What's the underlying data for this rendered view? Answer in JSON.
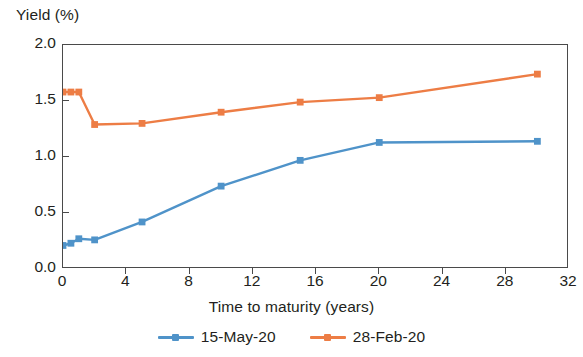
{
  "chart_data": {
    "type": "line",
    "title": "",
    "ylabel": "Yield (%)",
    "xlabel": "Time to maturity (years)",
    "xlim": [
      0,
      32
    ],
    "ylim": [
      0.0,
      2.0
    ],
    "xticks": [
      "0",
      "4",
      "8",
      "12",
      "16",
      "20",
      "24",
      "28",
      "32"
    ],
    "xtick_values": [
      0,
      4,
      8,
      12,
      16,
      20,
      24,
      28,
      32
    ],
    "yticks": [
      "0.0",
      "0.5",
      "1.0",
      "1.5",
      "2.0"
    ],
    "ytick_values": [
      0.0,
      0.5,
      1.0,
      1.5,
      2.0
    ],
    "grid": false,
    "legend_position": "bottom-center",
    "series": [
      {
        "name": "15-May-20",
        "color": "#4f93c9",
        "marker": "square",
        "x": [
          0,
          0.5,
          1,
          2,
          5,
          10,
          15,
          20,
          30
        ],
        "values": [
          0.21,
          0.23,
          0.27,
          0.26,
          0.42,
          0.74,
          0.97,
          1.13,
          1.14
        ]
      },
      {
        "name": "28-Feb-20",
        "color": "#ed7d45",
        "marker": "square",
        "x": [
          0,
          0.5,
          1,
          2,
          5,
          10,
          15,
          20,
          30
        ],
        "values": [
          1.58,
          1.58,
          1.58,
          1.29,
          1.3,
          1.4,
          1.49,
          1.53,
          1.74
        ]
      }
    ]
  },
  "legend": {
    "entries": [
      {
        "label": "15-May-20",
        "color": "#4f93c9"
      },
      {
        "label": "28-Feb-20",
        "color": "#ed7d45"
      }
    ]
  },
  "axes": {
    "frame_color": "#4a4a4a"
  }
}
